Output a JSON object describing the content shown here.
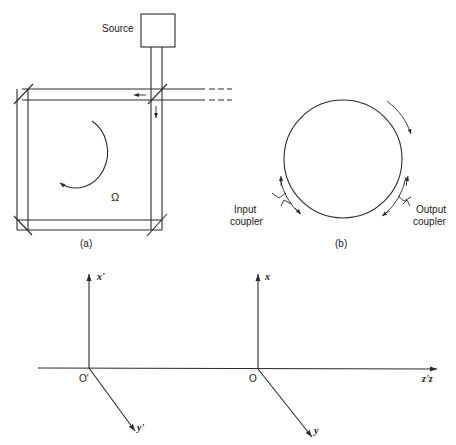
{
  "figure_a": {
    "source_label": "Source",
    "rotation_symbol": "Ω",
    "caption": "(a)"
  },
  "figure_b": {
    "input_coupler_label_line1": "Input",
    "input_coupler_label_line2": "coupler",
    "output_coupler_label_line1": "Output",
    "output_coupler_label_line2": "coupler",
    "caption": "(b)"
  },
  "figure_axes": {
    "primed_origin": "O'",
    "origin": "O",
    "x_prime_label": "x'",
    "y_prime_label": "y'",
    "x_label": "x",
    "y_label": "y",
    "z_label": "z'z"
  },
  "colors": {
    "ink": "#2a2a2a",
    "background": "#ffffff"
  }
}
